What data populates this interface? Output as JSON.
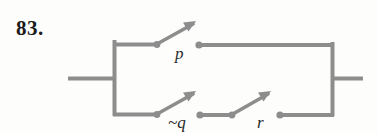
{
  "problem": {
    "number": "83."
  },
  "diagram": {
    "type": "switching-circuit",
    "title": "",
    "stroke_color": "#8d8d8d",
    "dot_color": "#8d8d8d",
    "label_color": "#2a2a2a",
    "background_color": "#fdfdfc",
    "branches": [
      {
        "name": "top-branch",
        "switches": [
          {
            "id": "p",
            "label": "p",
            "state": "open",
            "label_x": 175,
            "label_y": 59
          }
        ]
      },
      {
        "name": "bottom-branch",
        "switches": [
          {
            "id": "not-q",
            "label": "~q",
            "state": "open",
            "label_x": 168,
            "label_y": 128
          },
          {
            "id": "r",
            "label": "r",
            "state": "open",
            "label_x": 257,
            "label_y": 128
          }
        ]
      }
    ],
    "terminals": [
      {
        "name": "left-lead",
        "x1": 68,
        "y1": 78,
        "x2": 114,
        "y2": 78
      },
      {
        "name": "right-lead",
        "x1": 332,
        "y1": 78,
        "x2": 363,
        "y2": 78
      }
    ]
  }
}
